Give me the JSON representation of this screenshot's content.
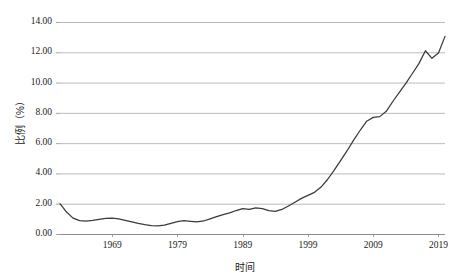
{
  "chart_data": {
    "type": "line",
    "title": "",
    "xlabel": "时间",
    "ylabel": "比例（%）",
    "xlim": [
      1961,
      2020
    ],
    "ylim": [
      0.0,
      14.0
    ],
    "grid": true,
    "legend": "none",
    "y_ticks": [
      "0.00",
      "2.00",
      "4.00",
      "6.00",
      "8.00",
      "10.00",
      "12.00",
      "14.00"
    ],
    "y_tick_values": [
      0.0,
      2.0,
      4.0,
      6.0,
      8.0,
      10.0,
      12.0,
      14.0
    ],
    "x_ticks": [
      "1969",
      "1979",
      "1989",
      "1999",
      "2009",
      "2019"
    ],
    "x_tick_values": [
      1969,
      1979,
      1989,
      1999,
      2009,
      2019
    ],
    "series": [
      {
        "name": "比例",
        "color": "#3a3a3a",
        "x": [
          1961,
          1962,
          1963,
          1964,
          1965,
          1966,
          1967,
          1968,
          1969,
          1970,
          1971,
          1972,
          1973,
          1974,
          1975,
          1976,
          1977,
          1978,
          1979,
          1980,
          1981,
          1982,
          1983,
          1984,
          1985,
          1986,
          1987,
          1988,
          1989,
          1990,
          1991,
          1992,
          1993,
          1994,
          1995,
          1996,
          1997,
          1998,
          1999,
          2000,
          2001,
          2002,
          2003,
          2004,
          2005,
          2006,
          2007,
          2008,
          2009,
          2010,
          2011,
          2012,
          2013,
          2014,
          2015,
          2016,
          2017,
          2018,
          2019,
          2020
        ],
        "values": [
          2.0,
          1.45,
          1.05,
          0.88,
          0.85,
          0.9,
          0.97,
          1.03,
          1.05,
          1.0,
          0.9,
          0.8,
          0.7,
          0.62,
          0.56,
          0.54,
          0.58,
          0.7,
          0.82,
          0.88,
          0.84,
          0.8,
          0.86,
          1.0,
          1.15,
          1.28,
          1.4,
          1.55,
          1.68,
          1.62,
          1.72,
          1.68,
          1.55,
          1.5,
          1.62,
          1.85,
          2.1,
          2.35,
          2.55,
          2.75,
          3.1,
          3.6,
          4.2,
          4.85,
          5.5,
          6.2,
          6.85,
          7.45,
          7.7,
          7.75,
          8.1,
          8.75,
          9.35,
          9.95,
          10.6,
          11.25,
          12.1,
          11.6,
          11.95,
          13.05
        ]
      }
    ]
  }
}
